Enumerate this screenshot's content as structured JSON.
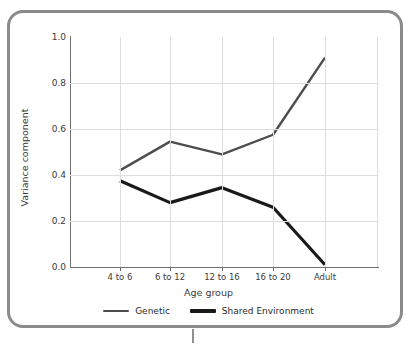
{
  "chart_data": {
    "type": "line",
    "title": "",
    "xlabel": "Age group",
    "ylabel": "Variance component",
    "categories": [
      "4 to 6",
      "6 to 12",
      "12 to 16",
      "16 to 20",
      "Adult"
    ],
    "ylim": [
      0.0,
      1.0
    ],
    "yticks": [
      "1.0",
      "0.8",
      "0.6",
      "0.4",
      "0.2",
      "0.0"
    ],
    "ytick_values": [
      1.0,
      0.8,
      0.6,
      0.4,
      0.2,
      0.0
    ],
    "grid": true,
    "legend_position": "bottom",
    "series": [
      {
        "name": "Genetic",
        "color": "#4d4d4d",
        "line_width": 2.4,
        "values": [
          0.42,
          0.545,
          0.49,
          0.575,
          0.91
        ]
      },
      {
        "name": "Shared Environment",
        "color": "#1a1a1a",
        "line_width": 3.2,
        "values": [
          0.375,
          0.28,
          0.345,
          0.26,
          0.01
        ]
      }
    ]
  },
  "frame": {
    "border_color": "#8b8b8b",
    "background": "#ffffff"
  },
  "axis": {
    "line_color": "#6e6e6e",
    "grid_color": "#dedede",
    "text_color": "#3a3a3a"
  }
}
